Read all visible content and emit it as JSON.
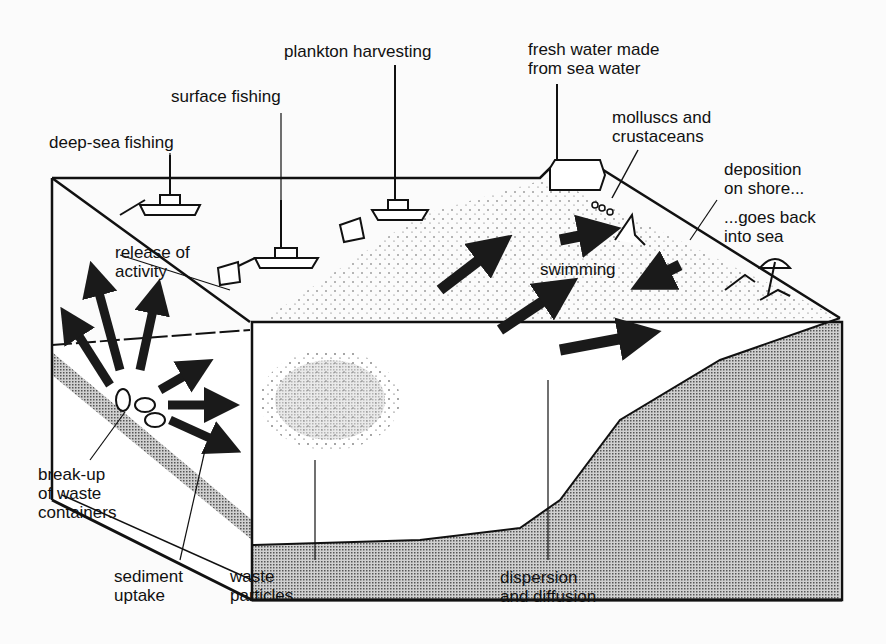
{
  "diagram": {
    "type": "block-diagram",
    "colors": {
      "ink": "#111111",
      "background": "#fbfbfb",
      "sediment_fill": "#b8b8b8",
      "arrow": "#1a1a1a"
    }
  },
  "labels": {
    "plankton": {
      "line1": "plankton harvesting"
    },
    "surface_fishing": {
      "line1": "surface fishing"
    },
    "deep_sea": {
      "line1": "deep-sea fishing"
    },
    "fresh_water": {
      "line1": "fresh water made",
      "line2": "from sea water"
    },
    "molluscs": {
      "line1": "molluscs and",
      "line2": "crustaceans"
    },
    "deposition": {
      "line1": "deposition",
      "line2": "on shore..."
    },
    "goes_back": {
      "line1": "...goes back",
      "line2": "into sea"
    },
    "release": {
      "line1": "release of",
      "line2": "activity"
    },
    "swimming": {
      "line1": "swimming"
    },
    "breakup": {
      "line1": "break-up",
      "line2": "of waste",
      "line3": "containers"
    },
    "sediment": {
      "line1": "sediment",
      "line2": "uptake"
    },
    "particles": {
      "line1": "waste",
      "line2": "particles"
    },
    "dispersion": {
      "line1": "dispersion",
      "line2": "and diffusion"
    }
  },
  "icons": [
    "fishing-boat-icon",
    "trawl-net-icon",
    "desalination-plant-icon",
    "shellfish-icon",
    "swimmer-icon",
    "beach-umbrella-icon",
    "sunbather-icon",
    "waste-container-icon",
    "arrow-icon"
  ]
}
